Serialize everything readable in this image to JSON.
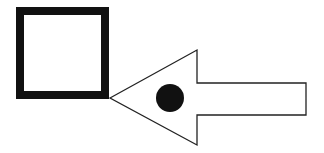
{
  "diagram": {
    "colors": {
      "stroke": "#111111",
      "fill": "#ffffff",
      "dot": "#111111"
    },
    "square": {
      "x": 20,
      "y": 11,
      "size": 85,
      "stroke_width": 8
    },
    "arrow": {
      "direction": "left",
      "tip": [
        110,
        98
      ],
      "head_top": [
        197,
        50
      ],
      "head_bottom": [
        197,
        145
      ],
      "shaft_top_y": 83,
      "shaft_bottom_y": 115,
      "shaft_right_x": 306
    },
    "dot": {
      "cx": 170,
      "cy": 98,
      "r": 14
    }
  }
}
